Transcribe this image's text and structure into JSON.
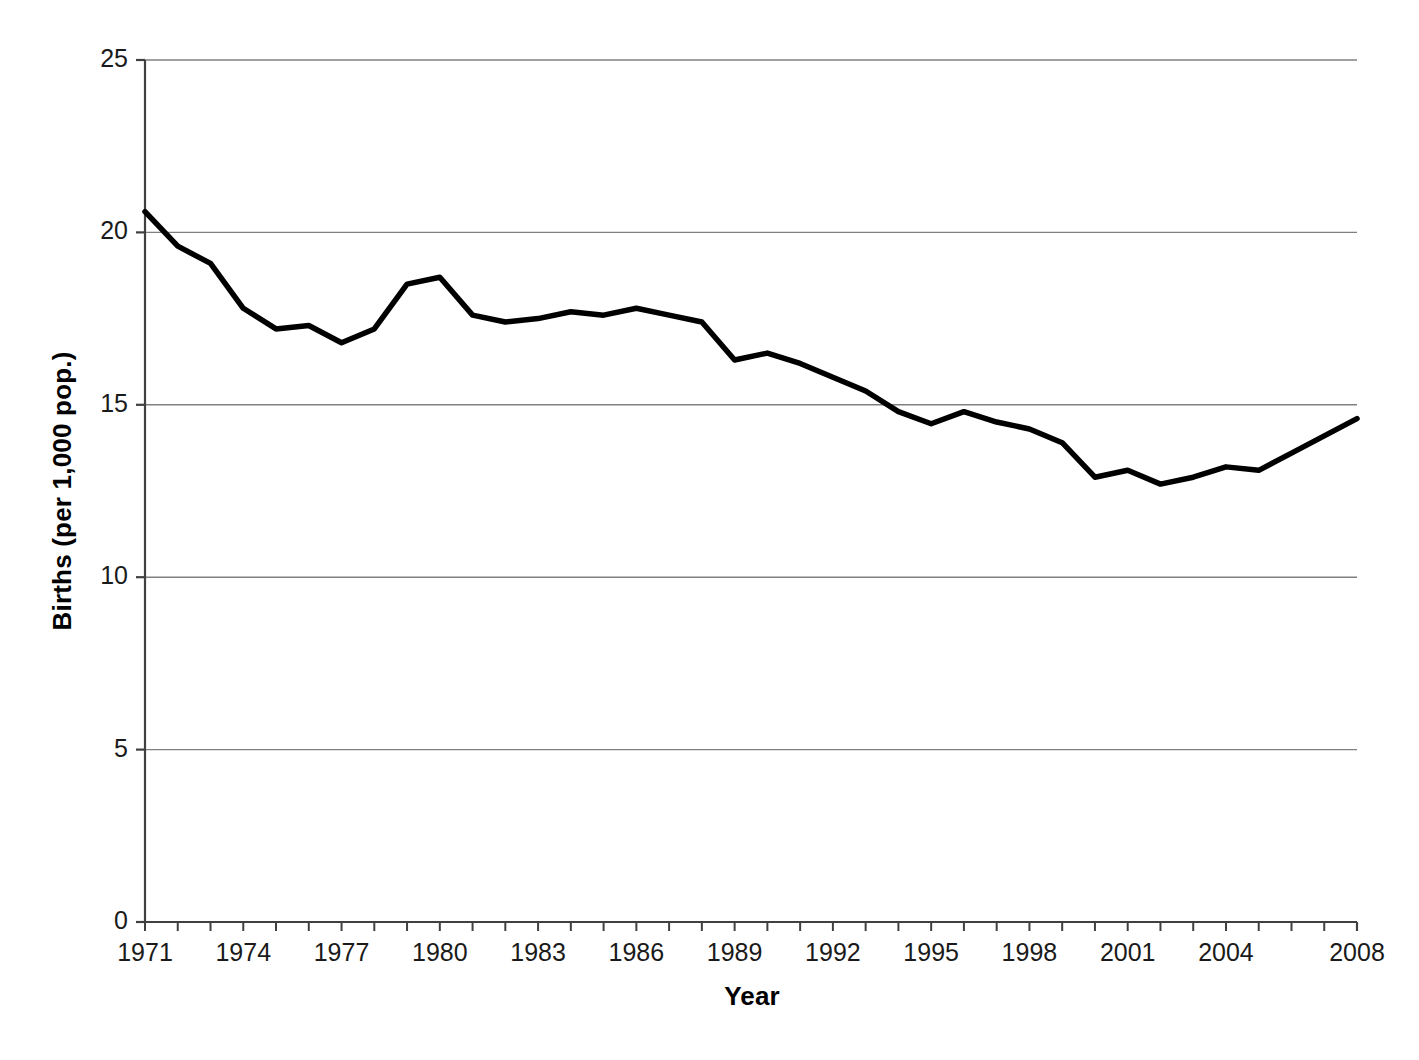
{
  "chart_data": {
    "type": "line",
    "title": "",
    "xlabel": "Year",
    "ylabel": "Births (per 1,000 pop.)",
    "xlim": [
      1971,
      2008
    ],
    "ylim": [
      0,
      25
    ],
    "grid": "horizontal",
    "legend": "none",
    "line_color": "#000000",
    "grid_color": "#808080",
    "axis_color": "#404040",
    "y_ticks": [
      0,
      5,
      10,
      15,
      20,
      25
    ],
    "y_tick_labels": [
      "0",
      "5",
      "10",
      "15",
      "20",
      "25"
    ],
    "x_tick_labels": [
      "1971",
      "1974",
      "1977",
      "1980",
      "1983",
      "1986",
      "1989",
      "1992",
      "1995",
      "1998",
      "2001",
      "2004",
      "2008"
    ],
    "x_tick_label_years": [
      1971,
      1974,
      1977,
      1980,
      1983,
      1986,
      1989,
      1992,
      1995,
      1998,
      2001,
      2004,
      2008
    ],
    "x_minor_ticks_every": 1,
    "x": [
      1971,
      1972,
      1973,
      1974,
      1975,
      1976,
      1977,
      1978,
      1979,
      1980,
      1981,
      1982,
      1983,
      1984,
      1985,
      1986,
      1987,
      1988,
      1989,
      1990,
      1991,
      1992,
      1993,
      1994,
      1995,
      1996,
      1997,
      1998,
      1999,
      2000,
      2001,
      2002,
      2003,
      2004,
      2005,
      2006,
      2007,
      2008
    ],
    "values": [
      20.6,
      19.6,
      19.1,
      17.8,
      17.2,
      17.3,
      16.8,
      17.2,
      18.5,
      18.7,
      17.6,
      17.4,
      17.5,
      17.7,
      17.6,
      17.8,
      17.6,
      17.4,
      16.3,
      16.5,
      16.2,
      15.8,
      15.4,
      14.8,
      14.45,
      14.8,
      14.5,
      14.3,
      13.9,
      12.9,
      13.1,
      12.7,
      12.9,
      13.2,
      13.1,
      13.6,
      14.1,
      14.6
    ],
    "series": [
      {
        "name": "Births per 1,000 population",
        "values": [
          20.6,
          19.6,
          19.1,
          17.8,
          17.2,
          17.3,
          16.8,
          17.2,
          18.5,
          18.7,
          17.6,
          17.4,
          17.5,
          17.7,
          17.6,
          17.8,
          17.6,
          17.4,
          16.3,
          16.5,
          16.2,
          15.8,
          15.4,
          14.8,
          14.45,
          14.8,
          14.5,
          14.3,
          13.9,
          12.9,
          13.1,
          12.7,
          12.9,
          13.2,
          13.1,
          13.6,
          14.1,
          14.6
        ]
      }
    ]
  },
  "geometry": {
    "plot_left": 145,
    "plot_right": 1357,
    "plot_top": 60,
    "plot_bottom": 922,
    "tick_out": 9,
    "minor_tick_len": 9,
    "line_width": 5.5,
    "x_axis_title_center": 752,
    "x_axis_title_top": 981,
    "y_axis_title_left": 62,
    "y_axis_title_center_y": 491
  }
}
